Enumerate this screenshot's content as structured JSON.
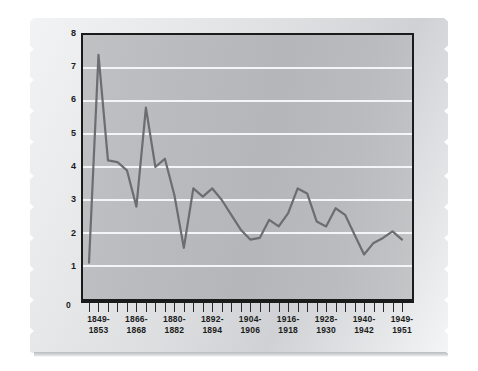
{
  "chart_data": {
    "type": "line",
    "title": "",
    "xlabel": "",
    "ylabel": "MURDER PER 100,000 POPULATION",
    "ylim": [
      0,
      8
    ],
    "yticks": [
      8,
      7,
      6,
      5,
      4,
      3,
      2,
      1
    ],
    "zero_label": "0",
    "grid": true,
    "gridlines_at": [
      7,
      6,
      5,
      4,
      3,
      2,
      1
    ],
    "legend": "none",
    "n_ticks": 34,
    "xtick_labels": [
      {
        "top": "1849-",
        "bottom": "1853",
        "tick_index": 1
      },
      {
        "top": "1866-",
        "bottom": "1868",
        "tick_index": 5
      },
      {
        "top": "1880-",
        "bottom": "1882",
        "tick_index": 9
      },
      {
        "top": "1892-",
        "bottom": "1894",
        "tick_index": 13
      },
      {
        "top": "1904-",
        "bottom": "1906",
        "tick_index": 17
      },
      {
        "top": "1916-",
        "bottom": "1918",
        "tick_index": 21
      },
      {
        "top": "1928-",
        "bottom": "1930",
        "tick_index": 25
      },
      {
        "top": "1940-",
        "bottom": "1942",
        "tick_index": 29
      },
      {
        "top": "1949-",
        "bottom": "1951",
        "tick_index": 33
      }
    ],
    "series": [
      {
        "name": "Murder rate",
        "color": "#6b6d70",
        "x": [
          0,
          1,
          2,
          3,
          4,
          5,
          6,
          7,
          8,
          9,
          10,
          11,
          12,
          13,
          14,
          15,
          16,
          17,
          18,
          19,
          20,
          21,
          22,
          23,
          24,
          25,
          26,
          27,
          28,
          29,
          30,
          31,
          32,
          33
        ],
        "values": [
          1.1,
          7.4,
          4.2,
          4.15,
          3.9,
          2.8,
          5.8,
          4.0,
          4.25,
          3.15,
          1.55,
          3.35,
          3.1,
          3.35,
          3.0,
          2.55,
          2.1,
          1.8,
          1.85,
          2.4,
          2.2,
          2.6,
          3.35,
          3.2,
          2.35,
          2.2,
          2.75,
          2.55,
          1.95,
          1.35,
          1.7,
          1.85,
          2.05,
          1.8
        ]
      }
    ]
  },
  "paper": {
    "style": "torn-edge-note",
    "tear_side_left": "tear-left-edge",
    "tear_side_right": "tear-right-edge"
  }
}
